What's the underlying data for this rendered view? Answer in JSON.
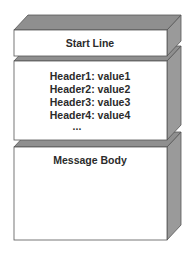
{
  "diagram": {
    "blocks": [
      {
        "id": "start-line",
        "lines": [
          "Start Line"
        ]
      },
      {
        "id": "headers",
        "lines": [
          "Header1: value1",
          "Header2: value2",
          "Header3: value3",
          "Header4: value4",
          "..."
        ]
      },
      {
        "id": "message-body",
        "lines": [
          "Message Body"
        ]
      }
    ],
    "colors": {
      "front_face": "#ffffff",
      "top_face": "#8f8f8f",
      "side_face": "#9a9a9a",
      "edge": "#555555",
      "text": "#2b2b2b"
    }
  }
}
